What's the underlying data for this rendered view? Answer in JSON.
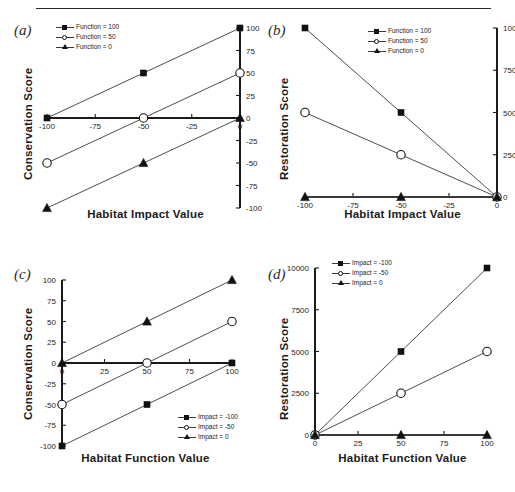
{
  "figure": {
    "top_rule": true,
    "panels": [
      "(a)",
      "(b)",
      "(c)",
      "(d)"
    ]
  },
  "chart_data": [
    {
      "panel": "(a)",
      "type": "line",
      "title": "",
      "xlabel": "Habitat Impact Value",
      "ylabel": "Conservation Score",
      "xlim": [
        -100,
        0
      ],
      "ylim": [
        -100,
        100
      ],
      "xticks": [
        -100,
        -75,
        -50,
        -25,
        0
      ],
      "yticks": [
        100,
        75,
        50,
        25,
        0,
        -25,
        -50,
        -75,
        -100
      ],
      "yaxis_side": "right",
      "grid": false,
      "legend_position": "top-left",
      "series": [
        {
          "name": "Function = 100",
          "marker": "square",
          "x": [
            -100,
            -50,
            0
          ],
          "values": [
            0,
            50,
            100
          ]
        },
        {
          "name": "Function = 50",
          "marker": "circle",
          "x": [
            -100,
            -50,
            0
          ],
          "values": [
            -50,
            0,
            50
          ]
        },
        {
          "name": "Function = 0",
          "marker": "triangle",
          "x": [
            -100,
            -50,
            0
          ],
          "values": [
            -100,
            -50,
            0
          ]
        }
      ]
    },
    {
      "panel": "(b)",
      "type": "line",
      "title": "",
      "xlabel": "Habitat Impact Value",
      "ylabel": "Restoration Score",
      "xlim": [
        -100,
        0
      ],
      "ylim": [
        0,
        10000
      ],
      "xticks": [
        -100,
        -75,
        -50,
        -25,
        0
      ],
      "yticks": [
        10000,
        7500,
        5000,
        2500,
        0
      ],
      "yaxis_side": "right",
      "grid": false,
      "legend_position": "top-center",
      "series": [
        {
          "name": "Function = 100",
          "marker": "square",
          "x": [
            -100,
            -50,
            0
          ],
          "values": [
            10000,
            5000,
            0
          ]
        },
        {
          "name": "Function = 50",
          "marker": "circle",
          "x": [
            -100,
            -50,
            0
          ],
          "values": [
            5000,
            2500,
            0
          ]
        },
        {
          "name": "Function = 0",
          "marker": "triangle",
          "x": [
            -100,
            -50,
            0
          ],
          "values": [
            0,
            0,
            0
          ]
        }
      ]
    },
    {
      "panel": "(c)",
      "type": "line",
      "title": "",
      "xlabel": "Habitat Function Value",
      "ylabel": "Conservation Score",
      "xlim": [
        0,
        100
      ],
      "ylim": [
        -100,
        100
      ],
      "xticks": [
        0,
        25,
        50,
        75,
        100
      ],
      "yticks": [
        100,
        75,
        50,
        25,
        0,
        -25,
        -50,
        -75,
        -100
      ],
      "yaxis_side": "left",
      "grid": false,
      "legend_position": "bottom-right",
      "series": [
        {
          "name": "Impact = -100",
          "marker": "square",
          "x": [
            0,
            50,
            100
          ],
          "values": [
            -100,
            -50,
            0
          ]
        },
        {
          "name": "Impact = -50",
          "marker": "circle",
          "x": [
            0,
            50,
            100
          ],
          "values": [
            -50,
            0,
            50
          ]
        },
        {
          "name": "Impact = 0",
          "marker": "triangle",
          "x": [
            0,
            50,
            100
          ],
          "values": [
            0,
            50,
            100
          ]
        }
      ]
    },
    {
      "panel": "(d)",
      "type": "line",
      "title": "",
      "xlabel": "Habitat Function Value",
      "ylabel": "Restoration Score",
      "xlim": [
        0,
        100
      ],
      "ylim": [
        0,
        10000
      ],
      "xticks": [
        0,
        25,
        50,
        75,
        100
      ],
      "yticks": [
        10000,
        7500,
        5000,
        2500,
        0
      ],
      "yaxis_side": "left",
      "grid": false,
      "legend_position": "top-center",
      "series": [
        {
          "name": "Impact = -100",
          "marker": "square",
          "x": [
            0,
            50,
            100
          ],
          "values": [
            0,
            5000,
            10000
          ]
        },
        {
          "name": "Impact = -50",
          "marker": "circle",
          "x": [
            0,
            50,
            100
          ],
          "values": [
            0,
            2500,
            5000
          ]
        },
        {
          "name": "Impact = 0",
          "marker": "triangle",
          "x": [
            0,
            50,
            100
          ],
          "values": [
            0,
            0,
            0
          ]
        }
      ]
    }
  ],
  "colors": {
    "line": "#3a3a3a",
    "axis": "#1b1b1b",
    "marker_fill": "#111111",
    "marker_open": "#ffffff",
    "text": "#1b1b1b"
  }
}
